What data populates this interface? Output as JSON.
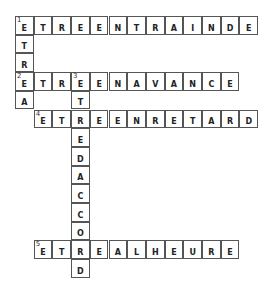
{
  "crossword": {
    "cell_size": 18.7,
    "words": [
      {
        "number": "1",
        "direction": "across",
        "row": 0,
        "col": 0,
        "answer": "ETREENTRAINDE"
      },
      {
        "number": "1",
        "direction": "down",
        "row": 0,
        "col": 0,
        "answer": "ETREA"
      },
      {
        "number": "2",
        "direction": "across",
        "row": 3,
        "col": 0,
        "answer": "ETREENAVANCE"
      },
      {
        "number": "3",
        "direction": "down",
        "row": 3,
        "col": 3,
        "answer": "ETREDACCORD"
      },
      {
        "number": "4",
        "direction": "across",
        "row": 5,
        "col": 1,
        "answer": "ETREENRETARD"
      },
      {
        "number": "5",
        "direction": "across",
        "row": 12,
        "col": 1,
        "answer": "ETREALHEURE"
      }
    ]
  }
}
